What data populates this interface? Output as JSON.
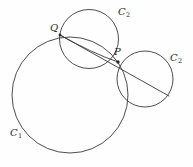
{
  "figure": {
    "background_color": "#fefefe",
    "stroke_color": "#3a3a3a",
    "label_color": "#2b2b2b",
    "width": 193,
    "height": 167
  },
  "labels": {
    "c1": {
      "base": "C",
      "sub": "1"
    },
    "c2_top": {
      "base": "C",
      "sub": "2"
    },
    "c2_right": {
      "base": "C",
      "sub": "2"
    },
    "point_p": "P",
    "point_q": "Q"
  },
  "geometry": {
    "circles": [
      {
        "name": "C1",
        "cx": 70,
        "cy": 95,
        "r": 58
      },
      {
        "name": "C2-top",
        "cx": 89,
        "cy": 39,
        "r": 29.5
      },
      {
        "name": "C2-right",
        "cx": 145,
        "cy": 79,
        "r": 28
      }
    ],
    "points": [
      {
        "name": "P",
        "x": 118,
        "y": 62
      },
      {
        "name": "Q",
        "x": 60,
        "y": 35
      }
    ],
    "secant_line": {
      "x1": 60,
      "y1": 35,
      "x2": 169,
      "y2": 96
    },
    "arc_q_to_p": {
      "x1": 60,
      "y1": 35,
      "cx": 92,
      "cy": 53,
      "x2": 118,
      "y2": 62
    }
  }
}
